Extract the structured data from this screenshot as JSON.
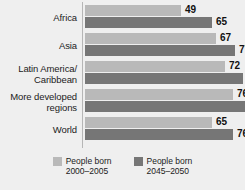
{
  "chart_data": {
    "type": "bar",
    "orientation": "horizontal",
    "title": "",
    "subtitle": "",
    "xlabel": "",
    "ylabel": "",
    "grid": false,
    "legend_position": "bottom",
    "xlim": [
      0,
      82
    ],
    "categories": [
      "Africa",
      "Asia",
      "Latin America/\nCaribbean",
      "More developed\nregions",
      "World"
    ],
    "series": [
      {
        "name": "People born\n2000–2005",
        "color": "#b9b9b9",
        "values": [
          49,
          67,
          72,
          76,
          65
        ],
        "labels": [
          "49",
          "67",
          "72",
          "76",
          "65"
        ]
      },
      {
        "name": "People born\n2045–2050",
        "color": "#767676",
        "values": [
          65,
          77,
          81,
          82,
          76
        ],
        "labels": [
          "65",
          "77",
          "8",
          "",
          "76"
        ]
      }
    ]
  },
  "legend": {
    "items": [
      {
        "label": "People born\n2000–2005",
        "color": "#b9b9b9"
      },
      {
        "label": "People born\n2045–2050",
        "color": "#767676"
      }
    ]
  },
  "colors": {
    "background": "#efefef",
    "series_light": "#b9b9b9",
    "series_dark": "#767676",
    "axis": "#b6b6b6",
    "text": "#1b1b1b"
  }
}
